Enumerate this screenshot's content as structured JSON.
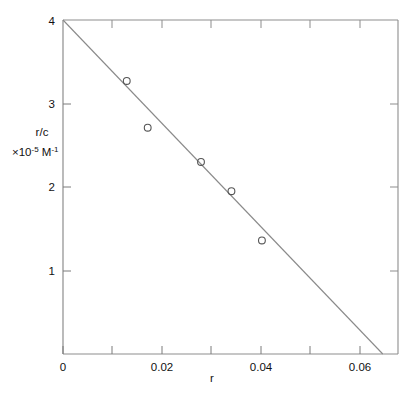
{
  "chart_data": {
    "type": "scatter",
    "title": "",
    "subtitle": "",
    "xlabel": "r",
    "ylabel_line1": "r/c",
    "ylabel_line2_prefix": "×10",
    "ylabel_line2_exp": "-5",
    "ylabel_line2_unit": "M",
    "ylabel_line2_unit_exp": "-1",
    "ylabel_full": "r/c ×10⁻⁵ M⁻¹",
    "xlim": [
      0,
      0.0704
    ],
    "ylim": [
      0,
      4
    ],
    "grid": false,
    "legend": null,
    "x_major_ticks": [
      0,
      0.02,
      0.04,
      0.06
    ],
    "x_major_tick_labels": [
      "0",
      "0.02",
      "0.04",
      "0.06"
    ],
    "x_minor_ticks": [
      0.01,
      0.03,
      0.05
    ],
    "y_major_ticks": [
      1,
      2,
      3,
      4
    ],
    "y_major_tick_labels": [
      "1",
      "2",
      "3",
      "4"
    ],
    "series": [
      {
        "name": "data",
        "marker": "open-circle",
        "x": [
          0.0134,
          0.0178,
          0.029,
          0.0354,
          0.0418
        ],
        "y": [
          3.27,
          2.71,
          2.3,
          1.95,
          1.36
        ]
      },
      {
        "name": "least-squares fit",
        "type": "line",
        "x": [
          0.0,
          0.0672
        ],
        "y": [
          4.0,
          0.0
        ],
        "intercept": 4.0,
        "slope": -59.5
      }
    ]
  },
  "figure": {
    "background_color": "#ffffff",
    "axis_color": "#6b6b6b",
    "line_color": "#8a8a8a",
    "marker_color": "#555555",
    "text_color": "#111111"
  }
}
